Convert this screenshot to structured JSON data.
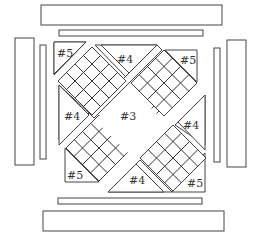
{
  "diagram": {
    "type": "quilt-block-assembly",
    "labels": {
      "center_square": "#3",
      "triangle_top": "#4",
      "triangle_left": "#4",
      "triangle_right": "#4",
      "triangle_bottom": "#4",
      "corner_top_left": "#5",
      "corner_top_right": "#5",
      "corner_bottom_left": "#5",
      "corner_bottom_right": "#5"
    },
    "pieces": {
      "checkerboard_units": 3,
      "checkerboard_grid": "4x4",
      "inner_borders": 4,
      "outer_borders": 4
    },
    "colors": {
      "stroke": "#444444",
      "fill": "#ffffff"
    }
  }
}
